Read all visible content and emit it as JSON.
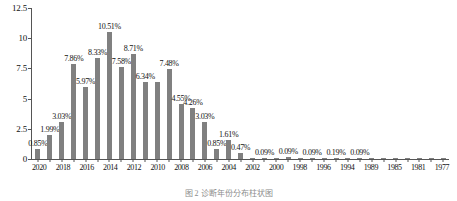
{
  "chart_data": {
    "type": "bar",
    "title": "",
    "xlabel": "",
    "ylabel": "",
    "ylim": [
      0,
      12.5
    ],
    "yticks": [
      "0",
      "2.5",
      "5",
      "7.5",
      "10",
      "12.5"
    ],
    "grid": false,
    "legend": "none",
    "bar_color": "#808080",
    "axis_color": "#555555",
    "categories": [
      "2020",
      "2019",
      "2018",
      "2017",
      "2016",
      "2015",
      "2014",
      "2013",
      "2012",
      "2011",
      "2010",
      "2009",
      "2008",
      "2007",
      "2006",
      "2005",
      "2004",
      "2003",
      "2002",
      "2001",
      "2000",
      "1999",
      "1998",
      "1997",
      "1996",
      "1995",
      "1994",
      "1993",
      "1989",
      "1987",
      "1985",
      "1983",
      "1981",
      "1979",
      "1977"
    ],
    "tick_labels": [
      "2020",
      "",
      "2018",
      "",
      "2016",
      "",
      "2014",
      "",
      "2012",
      "",
      "2010",
      "",
      "2008",
      "",
      "2006",
      "",
      "2004",
      "",
      "2002",
      "",
      "2000",
      "",
      "1998",
      "",
      "1996",
      "",
      "1994",
      "",
      "1989",
      "",
      "1985",
      "",
      "1981",
      "",
      "1977"
    ],
    "values": [
      0.85,
      1.99,
      3.03,
      7.86,
      5.97,
      8.33,
      10.51,
      7.58,
      8.71,
      6.34,
      6.34,
      7.48,
      4.55,
      4.26,
      3.03,
      0.85,
      1.61,
      0.47,
      0.09,
      0.09,
      0.09,
      0.19,
      0.09,
      0.09,
      0.09,
      0.09,
      0.09,
      0.09,
      0.09,
      0.09,
      0.09,
      0.09,
      0.09,
      0.09,
      0.09
    ],
    "data_labels": [
      "0.85%",
      "1.99%",
      "3.03%",
      "7.86%",
      "5.97%",
      "8.33%",
      "10.51%",
      "7.58%",
      "8.71%",
      "6.34%",
      "",
      "7.48%",
      "4.55%",
      "4.26%",
      "3.03%",
      "0.85%",
      "1.61%",
      "0.47%",
      "",
      "0.09%",
      "",
      "0.09%",
      "",
      "0.09%",
      "",
      "0.19%",
      "",
      "0.09%",
      "",
      "",
      "",
      "",
      "",
      "",
      ""
    ]
  },
  "caption": {
    "text": "图 2  诊断年份分布柱状图"
  }
}
